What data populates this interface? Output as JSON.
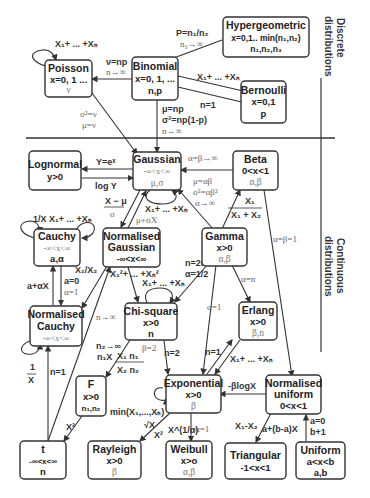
{
  "sections": {
    "discrete": [
      "Discrete",
      "distributions"
    ],
    "continuous": [
      "Continuous",
      "distributions"
    ]
  },
  "nodes": {
    "poisson": {
      "title": "Poisson",
      "support": "x=0, 1 ...",
      "params": "ν"
    },
    "binomial": {
      "title": "Binomial",
      "support": "x=0, 1, ...",
      "params": "n,p"
    },
    "hypergeometric": {
      "title": "Hypergeometric",
      "support": "x=0,1.. min(n₁,n₂)",
      "params": "n₁,n₂,n₃"
    },
    "bernoulli": {
      "title": "Bernoulli",
      "support": "x=0,1",
      "params": "p"
    },
    "lognormal": {
      "title": "Lognormal",
      "support": "y>0"
    },
    "gaussian": {
      "title": "Gaussian",
      "support": "-∞<x<∞",
      "params": "μ,σ"
    },
    "beta": {
      "title": "Beta",
      "support": "0<x<1",
      "params": "α,β"
    },
    "cauchy": {
      "title": "Cauchy",
      "support": "-∞<x<∞",
      "params": "a,α"
    },
    "normalised_gaussian": {
      "title1": "Normalised",
      "title2": "Gaussian",
      "support": "-∞<x<∞"
    },
    "gamma": {
      "title": "Gamma",
      "support": "x>0",
      "params": "α,β"
    },
    "normalised_cauchy": {
      "title1": "Normalised",
      "title2": "Cauchy",
      "support": "-∞<x<∞"
    },
    "chi_square": {
      "title": "Chi-square",
      "support": "x>0",
      "params": "n"
    },
    "erlang": {
      "title": "Erlang",
      "support": "x>0",
      "params": "β,n"
    },
    "f": {
      "title": "F",
      "support": "x>0",
      "params": "n₁,n₂"
    },
    "exponential": {
      "title": "Exponential",
      "support": "x>0",
      "params": "β"
    },
    "normalised_uniform": {
      "title1": "Normalised",
      "title2": "uniform",
      "support": "0<x<1"
    },
    "t": {
      "title": "t",
      "support": "-∞<x<∞",
      "params": "n"
    },
    "rayleigh": {
      "title": "Rayleigh",
      "support": "x>0",
      "params": "β"
    },
    "weibull": {
      "title": "Weibull",
      "support": "x>o",
      "params": "α,β"
    },
    "triangular": {
      "title": "Triangular",
      "support": "-1<x<1"
    },
    "uniform": {
      "title": "Uniform",
      "support": "a<x<b",
      "params": "a,b"
    }
  },
  "edges": {
    "poisson_self": "X₁+ ... +Xₙ",
    "binomial_poisson": [
      "ν=np",
      "n→∞"
    ],
    "binomial_hyper": [
      "P=n₁/n₂",
      "n₃→∞"
    ],
    "bernoulli_binomial": "X₁+ ... +Xₙ",
    "binomial_bernoulli": "n=1",
    "poisson_gaussian": [
      "σ²=ν",
      "μ=ν"
    ],
    "binomial_gaussian": [
      "μ=np",
      "σ²=np(1-p)",
      "n→∞"
    ],
    "lognormal_gaussian": "Y=eˣ",
    "gaussian_lognormal": "log Y",
    "beta_gaussian": "α=β→∞",
    "gamma_gaussian": [
      "μ=αβ",
      "σ²=αβ²",
      "α→∞"
    ],
    "gamma_beta": [
      "X₁",
      "X₁ + X₂"
    ],
    "gaussian_normgauss": [
      "X − μ",
      "σ"
    ],
    "normgauss_gaussian": "μ+σX",
    "gaussian_self": "X₁+ ... +Xₙ",
    "cauchy_self_inv": "1/X",
    "cauchy_self_sum": "X₁+ ... +Xₙ",
    "cauchy_normcauchy": [
      "a=0",
      "α=1"
    ],
    "normcauchy_cauchy": "a+αX",
    "normgauss_normcauchy": "X₁/X₂",
    "normgauss_chisq": "X₁²+ ... +Xₙ²",
    "chisq_self": "X₁+ ... +Xₙ",
    "gamma_chisq": [
      "n=2α",
      "α=1/2"
    ],
    "gamma_erlang": "α=n",
    "gamma_exponential": "α=1",
    "beta_normuniform": "α=β=1",
    "normcauchy_self": [
      "1",
      "X"
    ],
    "t_normcauchy": "n=1",
    "t_normgauss": "n→∞",
    "chisq_f": [
      "n₂→∞",
      "n₁X"
    ],
    "f_ratio": [
      "X₁ n₁",
      "X₂ n₂"
    ],
    "chisq_exponential_beta": "β=2",
    "chisq_exponential_n": "n=2",
    "erlang_exponential": "n=1",
    "exponential_erlang": "X₁+ ... +Xₙ",
    "exponential_self": "min(X₁,...,Xₙ)",
    "t_f": "X²",
    "normuniform_exponential": "-βlogX",
    "exponential_rayleigh": [
      "√X",
      "X²"
    ],
    "exponential_weibull_pow": "X^(1/α)",
    "weibull_exponential": "α=1",
    "normuniform_triangular": "X₁-X₂",
    "normuniform_uniform": "a+(b-a)X",
    "uniform_normuniform": [
      "a=0",
      "b+1"
    ]
  }
}
